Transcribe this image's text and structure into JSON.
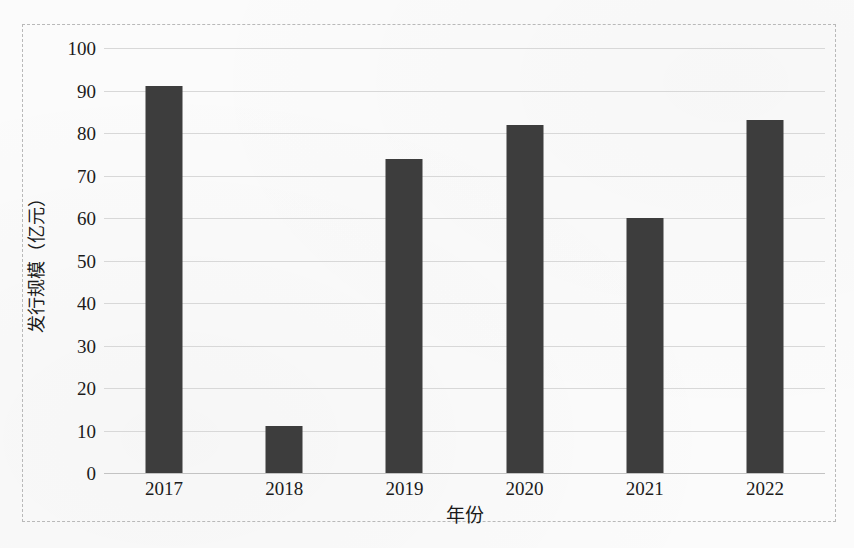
{
  "chart_data": {
    "type": "bar",
    "title": "",
    "xlabel": "年份",
    "ylabel": "发行规模（亿元）",
    "categories": [
      "2017",
      "2018",
      "2019",
      "2020",
      "2021",
      "2022"
    ],
    "values": [
      91,
      11,
      74,
      82,
      60,
      83
    ],
    "ylim": [
      0,
      100
    ],
    "ytick_labels": [
      "100",
      "90",
      "80",
      "70",
      "60",
      "50",
      "40",
      "30",
      "20",
      "10",
      "0"
    ],
    "ytick_values": [
      100,
      90,
      80,
      70,
      60,
      50,
      40,
      30,
      20,
      10,
      0
    ],
    "grid": true,
    "legend": false,
    "series": [
      {
        "name": "发行规模",
        "values": [
          91,
          11,
          74,
          82,
          60,
          83
        ],
        "color": "#3d3d3d"
      }
    ],
    "colors": {
      "bar": "#3d3d3d",
      "gridline": "#d8d8d8",
      "axis_text": "#1b1b1b",
      "frame": "#b9b9b9",
      "background": "#fbfbfb"
    }
  }
}
